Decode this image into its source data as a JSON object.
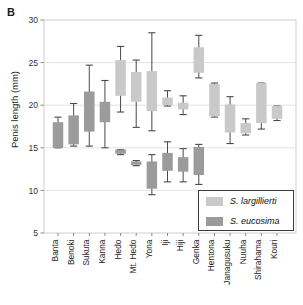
{
  "panel": {
    "label": "B"
  },
  "colors": {
    "largillierti": "#c9c9c9",
    "eucosima": "#9b9b9b",
    "whisker": "#4a4a4a",
    "grid": "#e3e3e3",
    "frame": "#cfcfcf",
    "text": "#1a1a1a"
  },
  "axes": {
    "ylabel": "Penis length (mm)",
    "xlabel": "",
    "yticks": [
      5,
      10,
      15,
      20,
      25,
      30
    ],
    "ylim": [
      5,
      30
    ]
  },
  "legend": {
    "position": "bottom-right",
    "entries": [
      {
        "label": "S. largillierti",
        "key": "largillierti",
        "color": "#c9c9c9"
      },
      {
        "label": "S. eucosima",
        "key": "eucosima",
        "color": "#9b9b9b"
      }
    ]
  },
  "chart_data": {
    "type": "box",
    "title": "",
    "xlabel": "",
    "ylabel": "Penis length (mm)",
    "ylim": [
      5,
      30
    ],
    "yticks": [
      5,
      10,
      15,
      20,
      25,
      30
    ],
    "grid": true,
    "legend_position": "bottom-right",
    "categories": [
      "Banta",
      "Benoki",
      "Sukuta",
      "Kanna",
      "Hedo",
      "Mt. Hedo",
      "Yona",
      "Iji",
      "Hiji",
      "Genka",
      "Hentona",
      "Janagusuku",
      "Nuuha",
      "Shirahama",
      "Kouri"
    ],
    "series": [
      {
        "name": "S. largillierti",
        "color": "#c9c9c9",
        "boxes": [
          null,
          null,
          null,
          null,
          {
            "category": "Hedo",
            "whisker_low": 19.2,
            "q1": 21.1,
            "q3": 25.3,
            "whisker_high": 26.9
          },
          {
            "category": "Mt. Hedo",
            "whisker_low": 17.4,
            "q1": 20.4,
            "q3": 23.9,
            "whisker_high": 25.3
          },
          {
            "category": "Yona",
            "whisker_low": 17.0,
            "q1": 19.3,
            "q3": 24.0,
            "whisker_high": 28.5
          },
          {
            "category": "Iji",
            "whisker_low": 19.9,
            "q1": 20.0,
            "q3": 20.9,
            "whisker_high": 21.7
          },
          {
            "category": "Hiji",
            "whisker_low": 18.9,
            "q1": 19.5,
            "q3": 20.3,
            "whisker_high": 21.1
          },
          {
            "category": "Genka",
            "whisker_low": 23.2,
            "q1": 23.8,
            "q3": 26.8,
            "whisker_high": 28.2
          },
          {
            "category": "Hentona",
            "whisker_low": 18.6,
            "q1": 18.7,
            "q3": 22.5,
            "whisker_high": 22.6
          },
          {
            "category": "Janagusuku",
            "whisker_low": 15.5,
            "q1": 16.8,
            "q3": 20.1,
            "whisker_high": 21.0
          },
          {
            "category": "Nuuha",
            "whisker_low": 16.5,
            "q1": 16.7,
            "q3": 17.9,
            "whisker_high": 18.4
          },
          {
            "category": "Shirahama",
            "whisker_low": 17.2,
            "q1": 17.9,
            "q3": 22.6,
            "whisker_high": 22.6
          },
          {
            "category": "Kouri",
            "whisker_low": 18.2,
            "q1": 18.4,
            "q3": 19.9,
            "whisker_high": 19.9
          }
        ]
      },
      {
        "name": "S. eucosima",
        "color": "#9b9b9b",
        "boxes": [
          {
            "category": "Banta",
            "whisker_low": 15.0,
            "q1": 15.0,
            "q3": 18.0,
            "whisker_high": 18.6
          },
          {
            "category": "Benoki",
            "whisker_low": 15.2,
            "q1": 15.4,
            "q3": 18.8,
            "whisker_high": 20.2
          },
          {
            "category": "Sukuta",
            "whisker_low": 15.2,
            "q1": 16.9,
            "q3": 21.6,
            "whisker_high": 24.7
          },
          {
            "category": "Kanna",
            "whisker_low": 15.0,
            "q1": 18.0,
            "q3": 20.4,
            "whisker_high": 22.9
          },
          {
            "category": "Hedo",
            "whisker_low": 14.2,
            "q1": 14.3,
            "q3": 14.8,
            "whisker_high": 14.8
          },
          {
            "category": "Mt. Hedo",
            "whisker_low": 12.9,
            "q1": 13.0,
            "q3": 13.4,
            "whisker_high": 13.5
          },
          {
            "category": "Yona",
            "whisker_low": 9.5,
            "q1": 10.2,
            "q3": 13.4,
            "whisker_high": 14.2
          },
          {
            "category": "Iji",
            "whisker_low": 11.0,
            "q1": 12.3,
            "q3": 14.4,
            "whisker_high": 15.7
          },
          {
            "category": "Hiji",
            "whisker_low": 11.0,
            "q1": 12.2,
            "q3": 13.9,
            "whisker_high": 14.9
          },
          {
            "category": "Genka",
            "whisker_low": 10.7,
            "q1": 11.8,
            "q3": 15.1,
            "whisker_high": 15.4
          },
          null,
          null,
          null,
          null,
          null
        ]
      }
    ]
  }
}
